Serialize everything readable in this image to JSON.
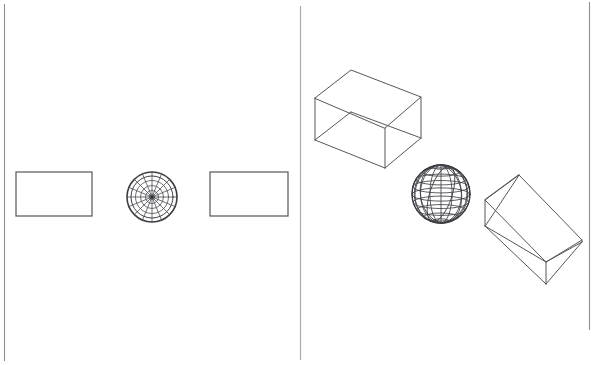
{
  "figure": {
    "background_color": "#ffffff",
    "line_color": "#4a4c50",
    "frame_color": "#8e9094",
    "width": 593,
    "height": 365
  },
  "frame": {
    "left_border_x": 4,
    "right_border_x": 589,
    "top_y": 4,
    "bottom_y": 361,
    "divider_x": 300,
    "divider_top_y": 6,
    "divider_bottom_y": 360
  },
  "panels": [
    {
      "id": "left-panel",
      "name": "orthographic-views-panel",
      "label": "Orthographic projections",
      "x": 4,
      "y": 4,
      "width": 296,
      "height": 357
    },
    {
      "id": "right-panel",
      "name": "three-d-views-panel",
      "label": "Three-dimensional wireframe views",
      "x": 300,
      "y": 4,
      "width": 289,
      "height": 357
    }
  ],
  "shapes": {
    "left": [
      {
        "name": "rectangle-left",
        "type": "rect",
        "x": 16,
        "y": 172,
        "width": 76,
        "height": 44,
        "stroke": "#54565a"
      },
      {
        "name": "circle-wireframe",
        "type": "radial-wireframe-circle",
        "cx": 152,
        "cy": 197,
        "r": 25,
        "rings": [
          5,
          10,
          15,
          20,
          25
        ],
        "spokes": 16,
        "stroke": "#3b3d41"
      },
      {
        "name": "rectangle-right",
        "type": "rect",
        "x": 210,
        "y": 172,
        "width": 78,
        "height": 44,
        "stroke": "#54565a"
      }
    ],
    "right": [
      {
        "name": "box-wireframe",
        "type": "box",
        "label": "Rectangular box",
        "vertices": {
          "top_left": [
            315,
            98
          ],
          "top_back": [
            351,
            70
          ],
          "top_right": [
            421,
            97
          ],
          "top_front": [
            385,
            128
          ],
          "bottom_left": [
            315,
            140
          ],
          "bottom_right": [
            421,
            138
          ],
          "bottom_front": [
            385,
            168
          ]
        },
        "stroke": "#55575b"
      },
      {
        "name": "sphere-wireframe",
        "type": "sphere",
        "label": "Wireframe globe",
        "cx": 441,
        "cy": 194,
        "r": 29,
        "latitudes": 7,
        "longitudes": 8,
        "stroke": "#3e4044"
      },
      {
        "name": "wedge-wireframe",
        "type": "wedge",
        "label": "Triangular wedge / ramp",
        "vertices": {
          "apex_top": [
            519,
            175
          ],
          "left_top": [
            485,
            200
          ],
          "left_bottom": [
            485,
            226
          ],
          "far_right": [
            582,
            242
          ],
          "front_bottom": [
            546,
            262
          ],
          "back_right": [
            582,
            240
          ]
        },
        "stroke": "#55575b"
      }
    ]
  },
  "annotations": {
    "has_text_labels": false,
    "has_axes": false,
    "has_legend": false
  }
}
